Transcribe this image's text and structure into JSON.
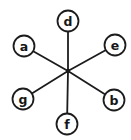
{
  "diagram": {
    "type": "star-graph",
    "background_color": "#ffffff",
    "stroke_color": "#1c1c1c",
    "node_fill_color": "#ffffff",
    "node_radius": 10.5,
    "center": {
      "x": 68,
      "y": 71,
      "dot_radius": 2.2
    },
    "nodes": [
      {
        "id": "d",
        "label": "d",
        "x": 68,
        "y": 21
      },
      {
        "id": "e",
        "label": "e",
        "x": 115,
        "y": 45
      },
      {
        "id": "b",
        "label": "b",
        "x": 114,
        "y": 100
      },
      {
        "id": "f",
        "label": "f",
        "x": 67,
        "y": 124
      },
      {
        "id": "g",
        "label": "g",
        "x": 23,
        "y": 99
      },
      {
        "id": "a",
        "label": "a",
        "x": 24,
        "y": 46
      }
    ],
    "edges": [
      [
        "d",
        "center"
      ],
      [
        "e",
        "center"
      ],
      [
        "b",
        "center"
      ],
      [
        "f",
        "center"
      ],
      [
        "g",
        "center"
      ],
      [
        "a",
        "center"
      ]
    ]
  }
}
